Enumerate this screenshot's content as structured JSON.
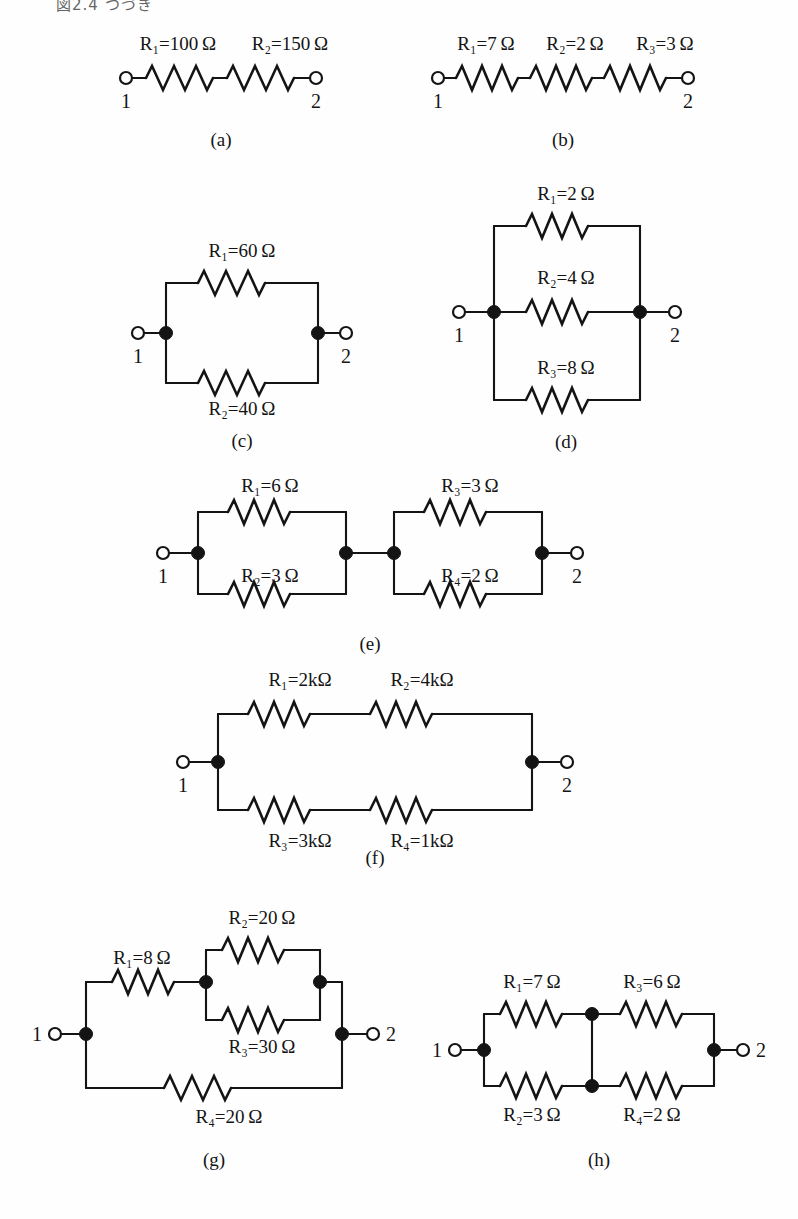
{
  "figure": {
    "clipped_header": "図2.4 つづき",
    "background": "#fefefe",
    "ink": "#141414",
    "terminal_left": "1",
    "terminal_right": "2"
  },
  "panels": [
    {
      "id": "a",
      "caption": "(a)",
      "topology": "series",
      "resistors": [
        {
          "name": "R",
          "index": "1",
          "eq": "=",
          "value": "100",
          "unit": "Ω",
          "label": "R₁=100 Ω"
        },
        {
          "name": "R",
          "index": "2",
          "eq": "=",
          "value": "150",
          "unit": "Ω",
          "label": "R₂=150 Ω"
        }
      ]
    },
    {
      "id": "b",
      "caption": "(b)",
      "topology": "series",
      "resistors": [
        {
          "name": "R",
          "index": "1",
          "eq": "=",
          "value": "7",
          "unit": "Ω",
          "label": "R₁=7 Ω"
        },
        {
          "name": "R",
          "index": "2",
          "eq": "=",
          "value": "2",
          "unit": "Ω",
          "label": "R₂=2 Ω"
        },
        {
          "name": "R",
          "index": "3",
          "eq": "=",
          "value": "3",
          "unit": "Ω",
          "label": "R₃=3 Ω"
        }
      ]
    },
    {
      "id": "c",
      "caption": "(c)",
      "topology": "parallel-2",
      "resistors": [
        {
          "name": "R",
          "index": "1",
          "eq": "=",
          "value": "60",
          "unit": "Ω",
          "label": "R₁=60 Ω"
        },
        {
          "name": "R",
          "index": "2",
          "eq": "=",
          "value": "40",
          "unit": "Ω",
          "label": "R₂=40 Ω"
        }
      ]
    },
    {
      "id": "d",
      "caption": "(d)",
      "topology": "parallel-3",
      "resistors": [
        {
          "name": "R",
          "index": "1",
          "eq": "=",
          "value": "2",
          "unit": "Ω",
          "label": "R₁=2 Ω"
        },
        {
          "name": "R",
          "index": "2",
          "eq": "=",
          "value": "4",
          "unit": "Ω",
          "label": "R₂=4 Ω"
        },
        {
          "name": "R",
          "index": "3",
          "eq": "=",
          "value": "8",
          "unit": "Ω",
          "label": "R₃=8 Ω"
        }
      ]
    },
    {
      "id": "e",
      "caption": "(e)",
      "topology": "two-parallel-pairs-in-series",
      "resistors": [
        {
          "name": "R",
          "index": "1",
          "eq": "=",
          "value": "6",
          "unit": "Ω",
          "label": "R₁=6 Ω"
        },
        {
          "name": "R",
          "index": "2",
          "eq": "=",
          "value": "3",
          "unit": "Ω",
          "label": "R₂=3 Ω"
        },
        {
          "name": "R",
          "index": "3",
          "eq": "=",
          "value": "3",
          "unit": "Ω",
          "label": "R₃=3 Ω"
        },
        {
          "name": "R",
          "index": "4",
          "eq": "=",
          "value": "2",
          "unit": "Ω",
          "label": "R₄=2 Ω"
        }
      ]
    },
    {
      "id": "f",
      "caption": "(f)",
      "topology": "two-series-branches-in-parallel",
      "resistors": [
        {
          "name": "R",
          "index": "1",
          "eq": "=",
          "value": "2k",
          "unit": "Ω",
          "label": "R₁=2kΩ"
        },
        {
          "name": "R",
          "index": "2",
          "eq": "=",
          "value": "4k",
          "unit": "Ω",
          "label": "R₂=4kΩ"
        },
        {
          "name": "R",
          "index": "3",
          "eq": "=",
          "value": "3k",
          "unit": "Ω",
          "label": "R₃=3kΩ"
        },
        {
          "name": "R",
          "index": "4",
          "eq": "=",
          "value": "1k",
          "unit": "Ω",
          "label": "R₄=1kΩ"
        }
      ]
    },
    {
      "id": "g",
      "caption": "(g)",
      "topology": "series-parallel-composite",
      "resistors": [
        {
          "name": "R",
          "index": "1",
          "eq": "=",
          "value": "8",
          "unit": "Ω",
          "label": "R₁=8 Ω"
        },
        {
          "name": "R",
          "index": "2",
          "eq": "=",
          "value": "20",
          "unit": "Ω",
          "label": "R₂=20 Ω"
        },
        {
          "name": "R",
          "index": "3",
          "eq": "=",
          "value": "30",
          "unit": "Ω",
          "label": "R₃=30 Ω"
        },
        {
          "name": "R",
          "index": "4",
          "eq": "=",
          "value": "20",
          "unit": "Ω",
          "label": "R₄=20 Ω"
        }
      ]
    },
    {
      "id": "h",
      "caption": "(h)",
      "topology": "bridged-ladder",
      "resistors": [
        {
          "name": "R",
          "index": "1",
          "eq": "=",
          "value": "7",
          "unit": "Ω",
          "label": "R₁=7 Ω"
        },
        {
          "name": "R",
          "index": "2",
          "eq": "=",
          "value": "3",
          "unit": "Ω",
          "label": "R₂=3 Ω"
        },
        {
          "name": "R",
          "index": "3",
          "eq": "=",
          "value": "6",
          "unit": "Ω",
          "label": "R₃=6 Ω"
        },
        {
          "name": "R",
          "index": "4",
          "eq": "=",
          "value": "2",
          "unit": "Ω",
          "label": "R₄=2 Ω"
        }
      ]
    }
  ]
}
